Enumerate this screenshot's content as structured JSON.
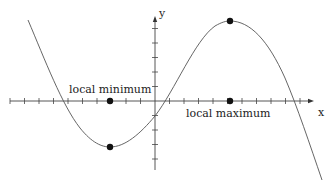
{
  "figure": {
    "axes": {
      "x_label": "x",
      "y_label": "y",
      "origin_px": [
        155,
        101
      ],
      "tick_spacing_px": 14.5,
      "x_ticks_left": 10,
      "x_ticks_right": 10,
      "y_ticks_up": 5,
      "y_ticks_down": 4
    },
    "labels": {
      "local_minimum": "local minimum",
      "local_maximum": "local maximum"
    },
    "points": {
      "local_min_on_curve": [
        110,
        147
      ],
      "local_min_on_axis": [
        110,
        101
      ],
      "local_max_on_curve": [
        230,
        21
      ],
      "local_max_on_axis": [
        230,
        101
      ]
    },
    "colors": {
      "curve": "#555555",
      "axis": "#444444",
      "dot": "#111111",
      "text": "#222222"
    }
  },
  "chart_data": {
    "type": "line",
    "title": "",
    "xlabel": "x",
    "ylabel": "y",
    "series": [
      {
        "name": "f(x)",
        "description": "Cubic curve, decreasing to a local minimum, increasing to a local maximum, then decreasing",
        "x": [
          -8.8,
          -6.8,
          -3.1,
          0,
          0.55,
          5.2,
          9.7,
          11.6
        ],
        "y": [
          5.5,
          0,
          -3.2,
          -1.0,
          0,
          5.5,
          0,
          -5.4
        ]
      }
    ],
    "annotations": [
      {
        "text": "local minimum",
        "x": -3.1,
        "y": -3.2,
        "axis_marker_x": -3.1
      },
      {
        "text": "local maximum",
        "x": 5.2,
        "y": 5.5,
        "axis_marker_x": 5.2
      }
    ],
    "grid": false
  }
}
